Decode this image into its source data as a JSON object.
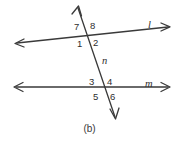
{
  "figure": {
    "caption": "(b)",
    "background_color": "#ffffff",
    "stroke_color": "#3a3a3a",
    "text_color": "#2e2e2e"
  },
  "lines": [
    {
      "id": "line-l",
      "label": "l",
      "orientation": "nearly horizontal, rising slightly to the right",
      "arrowheads": "both ends",
      "label_x": 148,
      "label_y": 20
    },
    {
      "id": "line-m",
      "label": "m",
      "orientation": "horizontal",
      "arrowheads": "both ends",
      "label_x": 145,
      "label_y": 79
    },
    {
      "id": "line-n",
      "label": "n",
      "orientation": "transversal, descending to the right",
      "arrowheads": "both ends",
      "label_x": 102,
      "label_y": 56
    }
  ],
  "angles": [
    {
      "number": "7",
      "x": 74,
      "y": 22,
      "intersection": "upper",
      "position": "above-left"
    },
    {
      "number": "8",
      "x": 90,
      "y": 21,
      "intersection": "upper",
      "position": "above-right"
    },
    {
      "number": "1",
      "x": 77,
      "y": 39,
      "intersection": "upper",
      "position": "below-left"
    },
    {
      "number": "2",
      "x": 93,
      "y": 38,
      "intersection": "upper",
      "position": "below-right"
    },
    {
      "number": "3",
      "x": 89,
      "y": 77,
      "intersection": "lower",
      "position": "above-left"
    },
    {
      "number": "4",
      "x": 107,
      "y": 77,
      "intersection": "lower",
      "position": "above-right"
    },
    {
      "number": "5",
      "x": 93,
      "y": 92,
      "intersection": "lower",
      "position": "below-left"
    },
    {
      "number": "6",
      "x": 110,
      "y": 92,
      "intersection": "lower",
      "position": "below-right"
    }
  ]
}
